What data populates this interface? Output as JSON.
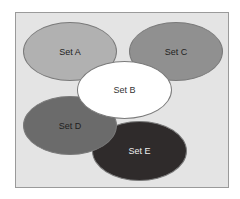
{
  "diagram": {
    "type": "venn-like overlapping ellipses",
    "background": "#e4e4e4",
    "sets": [
      {
        "id": "A",
        "label": "Set A",
        "fill": "#b1b1b1",
        "text": "#222222"
      },
      {
        "id": "B",
        "label": "Set B",
        "fill": "#ffffff",
        "text": "#333333"
      },
      {
        "id": "C",
        "label": "Set C",
        "fill": "#909090",
        "text": "#222222"
      },
      {
        "id": "D",
        "label": "Set D",
        "fill": "#6b6b6b",
        "text": "#1e1e1e"
      },
      {
        "id": "E",
        "label": "Set E",
        "fill": "#2f2b2b",
        "text": "#eeeeee"
      }
    ]
  }
}
